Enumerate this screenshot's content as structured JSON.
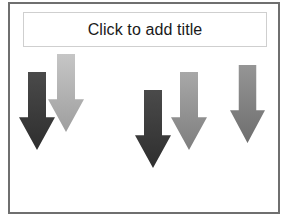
{
  "slide": {
    "title_placeholder": "Click to add title",
    "border_color": "#6f6f6f",
    "title_border_color": "#cfcfcf"
  },
  "arrows": [
    {
      "id": "arrow-1",
      "shade": "dark",
      "color_top": "#4a4a4a",
      "color_bottom": "#2e2e2e",
      "x": 19,
      "y": 72,
      "width": 36,
      "height": 78
    },
    {
      "id": "arrow-2",
      "shade": "light",
      "color_top": "#c6c6c6",
      "color_bottom": "#9e9e9e",
      "x": 48,
      "y": 54,
      "width": 36,
      "height": 78
    },
    {
      "id": "arrow-3",
      "shade": "dark",
      "color_top": "#4a4a4a",
      "color_bottom": "#2e2e2e",
      "x": 135,
      "y": 90,
      "width": 36,
      "height": 78
    },
    {
      "id": "arrow-4",
      "shade": "medium",
      "color_top": "#a8a8a8",
      "color_bottom": "#7e7e7e",
      "x": 171,
      "y": 72,
      "width": 36,
      "height": 78
    },
    {
      "id": "arrow-5",
      "shade": "medium",
      "color_top": "#959595",
      "color_bottom": "#6e6e6e",
      "x": 230,
      "y": 65,
      "width": 35,
      "height": 78
    }
  ]
}
